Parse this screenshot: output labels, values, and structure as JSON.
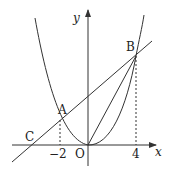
{
  "diagram": {
    "title": "",
    "axes": {
      "x_label": "x",
      "y_label": "y",
      "origin_label": "O"
    },
    "points": {
      "A": "A",
      "B": "B",
      "C": "C"
    },
    "ticks": {
      "neg2": "−2",
      "pos4": "4"
    },
    "curves": [
      "parabola through O, A, B",
      "line through C, A, B",
      "segment OB"
    ],
    "colors": {
      "stroke": "#333333",
      "background": "#ffffff"
    }
  }
}
